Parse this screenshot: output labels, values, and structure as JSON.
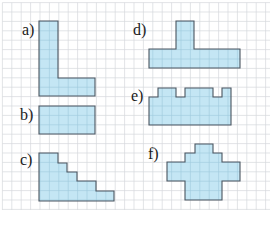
{
  "colors": {
    "background": "#ffffff",
    "grid_line": "#d6d9dc",
    "shape_fill": "#c4e6f4",
    "shape_inner_grid": "#9ec9dc",
    "shape_stroke": "#4a5560",
    "label": "#1a1a1a"
  },
  "grid": {
    "cell": 9.4,
    "x0": 2.4,
    "y0": 2.6,
    "x_max": 270,
    "y_max": 210
  },
  "shapes": [
    {
      "id": "a",
      "label": "a)",
      "label_pos": [
        22,
        22
      ],
      "points": [
        [
          39,
          21
        ],
        [
          58,
          21
        ],
        [
          58,
          78
        ],
        [
          95,
          78
        ],
        [
          95,
          96
        ],
        [
          39,
          96
        ]
      ]
    },
    {
      "id": "b",
      "label": "b)",
      "label_pos": [
        20,
        107
      ],
      "points": [
        [
          39,
          106
        ],
        [
          95,
          106
        ],
        [
          95,
          134
        ],
        [
          39,
          134
        ]
      ]
    },
    {
      "id": "c",
      "label": "c)",
      "label_pos": [
        20,
        152
      ],
      "points": [
        [
          39,
          153
        ],
        [
          58,
          153
        ],
        [
          58,
          163
        ],
        [
          67,
          163
        ],
        [
          67,
          172
        ],
        [
          77,
          172
        ],
        [
          77,
          181
        ],
        [
          96,
          181
        ],
        [
          96,
          191
        ],
        [
          114,
          191
        ],
        [
          114,
          201
        ],
        [
          39,
          201
        ]
      ]
    },
    {
      "id": "d",
      "label": "d)",
      "label_pos": [
        133,
        22
      ],
      "points": [
        [
          176,
          21
        ],
        [
          194,
          21
        ],
        [
          194,
          49
        ],
        [
          240,
          49
        ],
        [
          240,
          68
        ],
        [
          149,
          68
        ],
        [
          149,
          49
        ],
        [
          176,
          49
        ]
      ]
    },
    {
      "id": "e",
      "label": "e)",
      "label_pos": [
        131,
        88
      ],
      "points": [
        [
          149,
          97
        ],
        [
          158,
          97
        ],
        [
          158,
          88
        ],
        [
          176,
          88
        ],
        [
          176,
          97
        ],
        [
          185,
          97
        ],
        [
          185,
          88
        ],
        [
          213,
          88
        ],
        [
          213,
          97
        ],
        [
          222,
          97
        ],
        [
          222,
          88
        ],
        [
          231,
          88
        ],
        [
          231,
          125
        ],
        [
          149,
          125
        ]
      ]
    },
    {
      "id": "f",
      "label": "f)",
      "label_pos": [
        148,
        146
      ],
      "points": [
        [
          195,
          144
        ],
        [
          213,
          144
        ],
        [
          213,
          153
        ],
        [
          222,
          153
        ],
        [
          222,
          162
        ],
        [
          240,
          162
        ],
        [
          240,
          181
        ],
        [
          222,
          181
        ],
        [
          222,
          200
        ],
        [
          185,
          200
        ],
        [
          185,
          181
        ],
        [
          167,
          181
        ],
        [
          167,
          162
        ],
        [
          185,
          162
        ],
        [
          185,
          153
        ],
        [
          195,
          153
        ]
      ]
    }
  ]
}
